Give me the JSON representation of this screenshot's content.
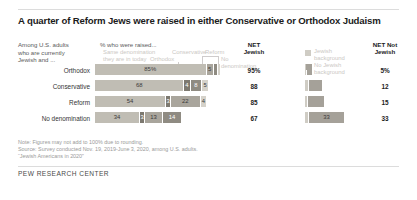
{
  "title": "A quarter of Reform Jews were raised in either Conservative or Orthodox Judaism",
  "left_header": "Among U.S. adults\nwho are currently\nJewish and ...",
  "chart_header": "% who were raised...",
  "legend_inline": {
    "same": "Same denomination\nthey are in today",
    "conservative": "Conservative",
    "reform": "Reform",
    "orthodox": "Orthodox",
    "no_denomination": "No denomination"
  },
  "legend_right": {
    "jewish_background": "Jewish\nbackground",
    "no_jewish_background": "No Jewish\nbackground"
  },
  "columns": {
    "net_jewish": "NET\nJewish",
    "net_not_jewish": "NET Not\nJewish"
  },
  "notes": [
    "Note: Figures may not add to 100% due to rounding.",
    "Source: Survey conducted Nov. 19, 2019-June 3, 2020, among U.S. adults.",
    "“Jewish Americans in 2020”"
  ],
  "footer": "PEW RESEARCH CENTER",
  "chart_data": {
    "type": "bar",
    "subtype": "stacked-horizontal-100",
    "title": "A quarter of Reform Jews were raised in either Conservative or Orthodox Judaism",
    "xlabel": "% who were raised...",
    "ylabel": "Among U.S. adults who are currently Jewish and ...",
    "xlim": [
      0,
      100
    ],
    "grid": false,
    "legend_position": "top-inline",
    "categories": [
      "Orthodox",
      "Conservative",
      "Reform",
      "No denomination"
    ],
    "segment_keys": [
      "same",
      "orthodox",
      "conservative",
      "reform",
      "no_denomination",
      "jewish_background",
      "no_jewish_background"
    ],
    "segment_labels": {
      "same": "Same denomination they are in today",
      "orthodox": "Orthodox",
      "conservative": "Conservative",
      "reform": "Reform",
      "no_denomination": "No denomination",
      "jewish_background": "Jewish background",
      "no_jewish_background": "No Jewish background"
    },
    "colors": {
      "same": "#c0bdb4",
      "orthodox": "#7d7970",
      "conservative": "#a9a59c",
      "reform": "#8f8b82",
      "no_denomination": "#d5d2ca",
      "jewish_background": "#cfccc4",
      "no_jewish_background": "#a5a199"
    },
    "rows": [
      {
        "category": "Orthodox",
        "left_stack": [
          {
            "key": "same",
            "value": 85,
            "label": "85%"
          },
          {
            "key": "conservative",
            "value": 5,
            "label": "5"
          },
          {
            "key": "reform",
            "value": 2,
            "label": ""
          },
          {
            "key": "no_denomination",
            "value": 2,
            "label": ""
          }
        ],
        "right_stack": [
          {
            "key": "jewish_background",
            "value": 1,
            "label": ""
          },
          {
            "key": "no_jewish_background",
            "value": 5,
            "label": ""
          }
        ],
        "net_jewish": "95%",
        "net_not_jewish": "5%"
      },
      {
        "category": "Conservative",
        "left_stack": [
          {
            "key": "same",
            "value": 68,
            "label": "68"
          },
          {
            "key": "orthodox",
            "value": 4,
            "label": "4"
          },
          {
            "key": "reform",
            "value": 8,
            "label": "8"
          },
          {
            "key": "no_denomination",
            "value": 5,
            "label": "5"
          }
        ],
        "right_stack": [
          {
            "key": "jewish_background",
            "value": 3,
            "label": ""
          },
          {
            "key": "no_jewish_background",
            "value": 12,
            "label": ""
          }
        ],
        "net_jewish": "88",
        "net_not_jewish": "12"
      },
      {
        "category": "Reform",
        "left_stack": [
          {
            "key": "same",
            "value": 54,
            "label": "54"
          },
          {
            "key": "orthodox",
            "value": 3,
            "label": "3"
          },
          {
            "key": "conservative",
            "value": 22,
            "label": "22"
          },
          {
            "key": "no_denomination",
            "value": 4,
            "label": "4"
          }
        ],
        "right_stack": [
          {
            "key": "jewish_background",
            "value": 2,
            "label": ""
          },
          {
            "key": "no_jewish_background",
            "value": 15,
            "label": ""
          }
        ],
        "net_jewish": "85",
        "net_not_jewish": "15"
      },
      {
        "category": "No denomination",
        "left_stack": [
          {
            "key": "same",
            "value": 34,
            "label": "34"
          },
          {
            "key": "orthodox",
            "value": 3,
            "label": "3"
          },
          {
            "key": "conservative",
            "value": 13,
            "label": "13"
          },
          {
            "key": "reform",
            "value": 14,
            "label": "14"
          }
        ],
        "right_stack": [
          {
            "key": "jewish_background",
            "value": 3,
            "label": ""
          },
          {
            "key": "no_jewish_background",
            "value": 33,
            "label": "33"
          }
        ],
        "net_jewish": "67",
        "net_not_jewish": "33"
      }
    ]
  }
}
